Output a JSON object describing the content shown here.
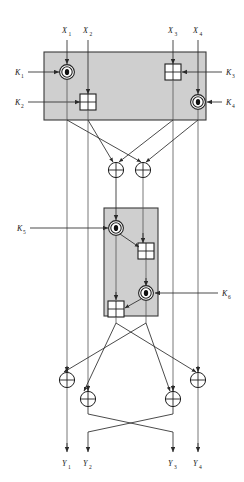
{
  "figure": {
    "background_color": "#ffffff",
    "box_fill_color": "#cfcfcf",
    "line_color": "#2b2b2b"
  },
  "inputs": [
    {
      "id": "x1",
      "base": "X",
      "sub": "1",
      "x": 62,
      "y": 33
    },
    {
      "id": "x2",
      "base": "X",
      "sub": "2",
      "x": 85,
      "y": 33
    },
    {
      "id": "x3",
      "base": "X",
      "sub": "3",
      "x": 170,
      "y": 33
    },
    {
      "id": "x4",
      "base": "X",
      "sub": "4",
      "x": 196,
      "y": 33
    }
  ],
  "outputs": [
    {
      "id": "y1",
      "base": "Y",
      "sub": "1",
      "x": 55,
      "y": 465
    },
    {
      "id": "y2",
      "base": "Y",
      "sub": "2",
      "x": 80,
      "y": 465
    },
    {
      "id": "y3",
      "base": "Y",
      "sub": "3",
      "x": 164,
      "y": 465
    },
    {
      "id": "y4",
      "base": "Y",
      "sub": "4",
      "x": 190,
      "y": 465
    }
  ],
  "subkeys": [
    {
      "id": "k1",
      "base": "K",
      "sub": "1",
      "x": 16,
      "y": 74,
      "side": "left"
    },
    {
      "id": "k2",
      "base": "K",
      "sub": "2",
      "x": 16,
      "y": 106,
      "side": "left"
    },
    {
      "id": "k3",
      "base": "K",
      "sub": "3",
      "x": 226,
      "y": 74,
      "side": "right"
    },
    {
      "id": "k4",
      "base": "K",
      "sub": "4",
      "x": 226,
      "y": 106,
      "side": "right"
    },
    {
      "id": "k5",
      "base": "K",
      "sub": "5",
      "x": 18,
      "y": 232,
      "side": "left"
    },
    {
      "id": "k6",
      "base": "K",
      "sub": "6",
      "x": 222,
      "y": 293,
      "side": "right"
    }
  ],
  "panels": [
    {
      "id": "upper-panel",
      "x": 44,
      "y": 52,
      "w": 162,
      "h": 68
    },
    {
      "id": "lower-panel",
      "x": 104,
      "y": 208,
      "w": 54,
      "h": 108
    }
  ],
  "operators": {
    "multiply_symbol_name": "circle-dot-operator",
    "add_symbol_name": "box-plus-operator",
    "xor_symbol_name": "xor-circle-operator"
  },
  "ops": [
    {
      "id": "op-mul-1",
      "kind": "circle-dot",
      "cx": 67,
      "cy": 72,
      "panel": "upper"
    },
    {
      "id": "op-add-1",
      "kind": "box-plus",
      "cx": 88,
      "cy": 102,
      "panel": "upper"
    },
    {
      "id": "op-add-2",
      "kind": "box-plus",
      "cx": 173,
      "cy": 72,
      "panel": "upper"
    },
    {
      "id": "op-mul-2",
      "kind": "circle-dot",
      "cx": 198,
      "cy": 102,
      "panel": "upper"
    },
    {
      "id": "op-xor-a",
      "kind": "xor",
      "cx": 116,
      "cy": 170,
      "panel": "mid"
    },
    {
      "id": "op-xor-b",
      "kind": "xor",
      "cx": 143,
      "cy": 170,
      "panel": "mid"
    },
    {
      "id": "op-mul-3",
      "kind": "circle-dot",
      "cx": 116,
      "cy": 228,
      "panel": "lower"
    },
    {
      "id": "op-add-3",
      "kind": "box-plus",
      "cx": 146,
      "cy": 251,
      "panel": "lower"
    },
    {
      "id": "op-mul-4",
      "kind": "circle-dot",
      "cx": 146,
      "cy": 293,
      "panel": "lower"
    },
    {
      "id": "op-add-4",
      "kind": "box-plus",
      "cx": 116,
      "cy": 309,
      "panel": "lower"
    },
    {
      "id": "op-xor-1",
      "kind": "xor",
      "cx": 60,
      "cy": 380,
      "panel": "out"
    },
    {
      "id": "op-xor-2",
      "kind": "xor",
      "cx": 81,
      "cy": 399,
      "panel": "out"
    },
    {
      "id": "op-xor-3",
      "kind": "xor",
      "cx": 172,
      "cy": 399,
      "panel": "out"
    },
    {
      "id": "op-xor-4",
      "kind": "xor",
      "cx": 200,
      "cy": 380,
      "panel": "out"
    }
  ]
}
